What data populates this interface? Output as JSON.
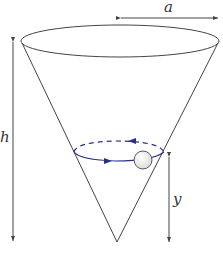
{
  "diagram": {
    "type": "conical-pendulum / particle in inverted cone",
    "labels": {
      "radius": "a",
      "height": "h",
      "particle_height": "y"
    },
    "colors": {
      "outline": "#444444",
      "orbit": "#2b2d8a",
      "ball_fill": "#eef2ee",
      "ball_stroke": "#555555"
    }
  }
}
